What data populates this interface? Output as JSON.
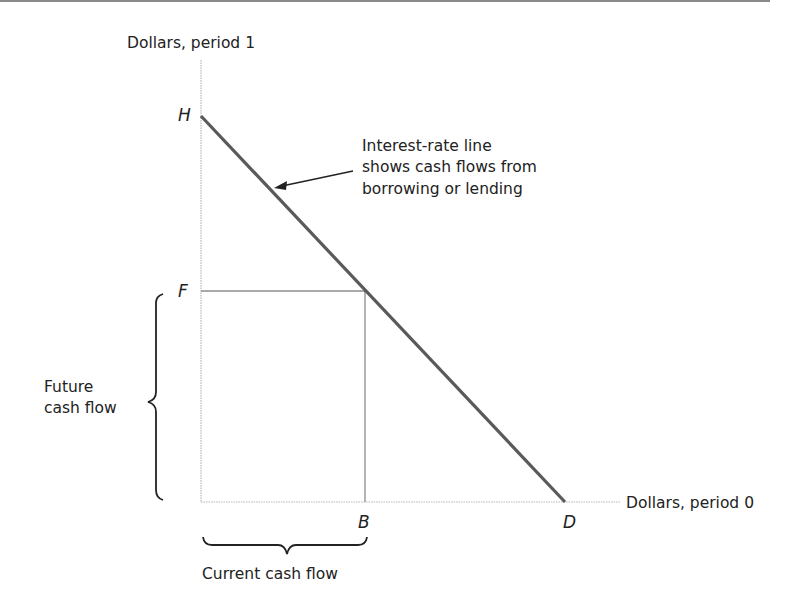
{
  "axes": {
    "y_label": "Dollars, period 1",
    "x_label": "Dollars, period 0"
  },
  "points": {
    "H": "H",
    "F": "F",
    "B": "B",
    "D": "D"
  },
  "annotation": {
    "line1": "Interest-rate line",
    "line2": "shows cash flows from",
    "line3": "borrowing or lending"
  },
  "braces": {
    "future_line1": "Future",
    "future_line2": "cash flow",
    "current": "Current cash flow"
  },
  "colors": {
    "interest_line": "#5a5a5a",
    "axis": "#b8b8b8",
    "guide": "#8c8c8c",
    "text": "#222222"
  }
}
